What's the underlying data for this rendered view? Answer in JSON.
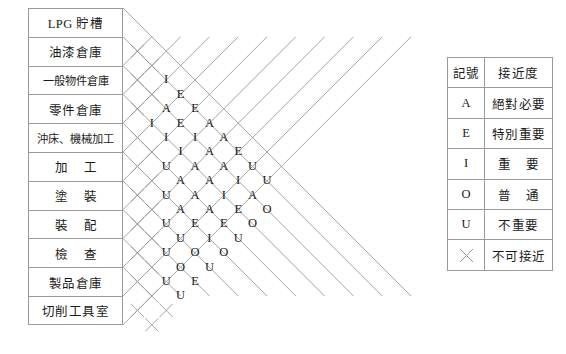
{
  "chart_data": {
    "type": "table",
    "title": "",
    "diagram_kind": "activity-relationship-chart",
    "activities": [
      "LPG 貯槽",
      "油漆倉庫",
      "一般物件倉庫",
      "零件倉庫",
      "沖床、機械加工",
      "加 工",
      "塗 裝",
      "裝 配",
      "檢 查",
      "製品倉庫",
      "切削工具室"
    ],
    "activity_display": [
      {
        "text": "LPG 貯槽",
        "style": "normal"
      },
      {
        "text": "油漆倉庫",
        "style": "normal"
      },
      {
        "text": "一般物件倉庫",
        "style": "wide"
      },
      {
        "text": "零件倉庫",
        "style": "normal"
      },
      {
        "text": "沖床、機械加工",
        "style": "wide"
      },
      {
        "text": "加工",
        "style": "spaced"
      },
      {
        "text": "塗裝",
        "style": "spaced"
      },
      {
        "text": "裝配",
        "style": "spaced"
      },
      {
        "text": "檢查",
        "style": "spaced"
      },
      {
        "text": "製品倉庫",
        "style": "normal"
      },
      {
        "text": "切削工具室",
        "style": "normal"
      }
    ],
    "rating_matrix": [
      [
        "X",
        "X",
        "I",
        "E",
        "E",
        "A",
        "A",
        "E",
        "U",
        "U"
      ],
      [
        "X",
        "X",
        "A",
        "E",
        "I",
        "A",
        "A",
        "I",
        "A",
        "O"
      ],
      [
        "X",
        "I",
        "I",
        "I",
        "A",
        "A",
        "I",
        "E",
        "O"
      ],
      [
        "X",
        "X",
        "U",
        "A",
        "A",
        "A",
        "E",
        "U"
      ],
      [
        "X",
        "X",
        "U",
        "A",
        "E",
        "I",
        "O"
      ],
      [
        "X",
        "X",
        "U",
        "U",
        "O",
        "U"
      ],
      [
        "X",
        "X",
        "U",
        "O",
        "E"
      ],
      [
        "X",
        "X",
        "U",
        "U"
      ],
      [
        "X",
        "X",
        "X"
      ],
      [
        "X",
        "X"
      ]
    ],
    "xlabel": "",
    "ylabel": "",
    "grid": true,
    "legend_position": "right"
  },
  "legend": {
    "header": {
      "symbol": "記號",
      "description": "接近度"
    },
    "rows": [
      {
        "symbol": "A",
        "description": "絕對必要",
        "spaced": false
      },
      {
        "symbol": "E",
        "description": "特別重要",
        "spaced": false
      },
      {
        "symbol": "I",
        "description": "重要",
        "spaced": true
      },
      {
        "symbol": "O",
        "description": "普通",
        "spaced": true
      },
      {
        "symbol": "U",
        "description": "不重要",
        "spaced": false
      },
      {
        "symbol": "X",
        "description": "不可接近",
        "spaced": false
      }
    ]
  },
  "caption": {
    "text": ""
  },
  "colors": {
    "line": "#9a9a9a",
    "text": "#1a1a1a",
    "background": "#ffffff"
  }
}
